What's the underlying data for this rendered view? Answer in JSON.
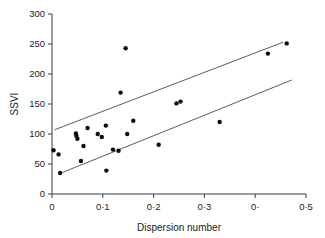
{
  "chart_data": {
    "type": "scatter",
    "title": "",
    "xlabel": "Dispersion number",
    "ylabel": "SSVI",
    "xlim": [
      0,
      0.5
    ],
    "ylim": [
      0,
      300
    ],
    "grid": false,
    "legend": null,
    "xticks": [
      0,
      0.1,
      0.2,
      0.3,
      0.4,
      0.5
    ],
    "xtick_labels": [
      "0",
      "0·1",
      "0·2",
      "0·3",
      "0·",
      "0·5"
    ],
    "yticks": [
      0,
      50,
      100,
      150,
      200,
      250,
      300
    ],
    "ytick_labels": [
      "0",
      "50",
      "100",
      "150",
      "200",
      "250",
      "300"
    ],
    "marker": "filled-circle",
    "marker_color": "#0d0d0d",
    "points": [
      {
        "x": 0.003,
        "y": 73
      },
      {
        "x": 0.013,
        "y": 66
      },
      {
        "x": 0.016,
        "y": 35
      },
      {
        "x": 0.047,
        "y": 101
      },
      {
        "x": 0.048,
        "y": 97
      },
      {
        "x": 0.05,
        "y": 92
      },
      {
        "x": 0.057,
        "y": 55
      },
      {
        "x": 0.062,
        "y": 80
      },
      {
        "x": 0.07,
        "y": 110
      },
      {
        "x": 0.09,
        "y": 100
      },
      {
        "x": 0.098,
        "y": 95
      },
      {
        "x": 0.106,
        "y": 114
      },
      {
        "x": 0.107,
        "y": 39
      },
      {
        "x": 0.12,
        "y": 74
      },
      {
        "x": 0.131,
        "y": 72
      },
      {
        "x": 0.135,
        "y": 169
      },
      {
        "x": 0.145,
        "y": 243
      },
      {
        "x": 0.148,
        "y": 100
      },
      {
        "x": 0.16,
        "y": 122
      },
      {
        "x": 0.21,
        "y": 82
      },
      {
        "x": 0.245,
        "y": 151
      },
      {
        "x": 0.253,
        "y": 154
      },
      {
        "x": 0.33,
        "y": 120
      },
      {
        "x": 0.425,
        "y": 234
      },
      {
        "x": 0.462,
        "y": 251
      }
    ],
    "lines": [
      {
        "name": "upper-bound-line",
        "x1": 0.005,
        "y1": 107,
        "x2": 0.455,
        "y2": 253
      },
      {
        "name": "lower-bound-line",
        "x1": 0.018,
        "y1": 35,
        "x2": 0.472,
        "y2": 190
      }
    ]
  },
  "axes": {
    "x_title": "Dispersion number",
    "y_title": "SSVI"
  }
}
